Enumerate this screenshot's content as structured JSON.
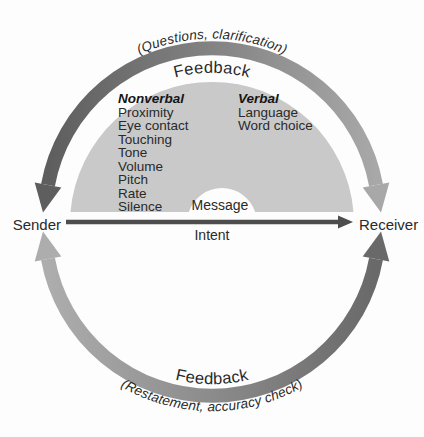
{
  "diagram": {
    "sender_label": "Sender",
    "receiver_label": "Receiver",
    "message_label": "Message",
    "intent_label": "Intent",
    "top_loop": {
      "annotation": "(Questions, clarification)",
      "label": "Feedback"
    },
    "bottom_loop": {
      "label": "Feedback",
      "annotation": "(Restatement, accuracy check)"
    },
    "dome": {
      "nonverbal": {
        "heading": "Nonverbal",
        "items": [
          "Proximity",
          "Eye contact",
          "Touching",
          "Tone",
          "Volume",
          "Pitch",
          "Rate",
          "Silence"
        ]
      },
      "verbal": {
        "heading": "Verbal",
        "items": [
          "Language",
          "Word choice"
        ]
      }
    },
    "colors": {
      "top_arc_dark": "#5e5e5e",
      "top_arc_light": "#a8a8a8",
      "bottom_arc_light": "#adadad",
      "bottom_arc_dark": "#696969",
      "dome_fill": "#c9c9c9",
      "notch_fill": "#fdfdfd",
      "arrow": "#4d4d4d"
    }
  }
}
